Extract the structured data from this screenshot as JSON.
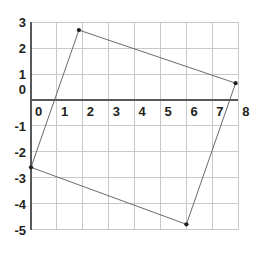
{
  "chart_data": {
    "type": "scatter",
    "title": "",
    "xlabel": "",
    "ylabel": "",
    "xlim": [
      0,
      8
    ],
    "ylim": [
      -5,
      3
    ],
    "grid": true,
    "legend": null,
    "x_ticks": [
      0,
      1,
      2,
      3,
      4,
      5,
      6,
      7,
      8
    ],
    "y_ticks": [
      3,
      2,
      1,
      0,
      -1,
      -2,
      -3,
      -4,
      -5
    ],
    "x_tick_labels": [
      "0",
      "1",
      "2",
      "3",
      "4",
      "5",
      "6",
      "7",
      "8"
    ],
    "y_tick_labels": [
      "3",
      "2",
      "1",
      "0",
      "-1",
      "-2",
      "-3",
      "-4",
      "-5"
    ],
    "origin_label": "0",
    "series": [
      {
        "name": "quadrilateral",
        "type": "polygon",
        "closed": true,
        "points": [
          {
            "x": 1.85,
            "y": 2.7
          },
          {
            "x": 7.9,
            "y": 0.65
          },
          {
            "x": 6.0,
            "y": -4.8
          },
          {
            "x": 0.0,
            "y": -2.6
          }
        ]
      }
    ],
    "colors": {
      "grid": "#c9c9c9",
      "axis": "#58595b",
      "shape_stroke": "#58595b",
      "vertex_marker": "#231f20",
      "label_text": "#231f20",
      "background": "#ffffff"
    }
  }
}
